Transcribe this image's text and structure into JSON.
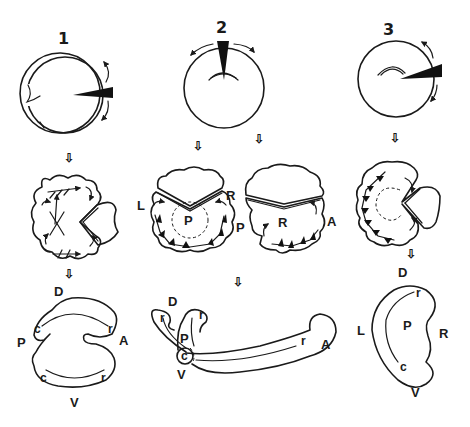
{
  "panels": [
    {
      "number": "1",
      "stage2_labels": [],
      "stage3_labels": {
        "top": "D",
        "left": "P",
        "right": "A",
        "bottom": "V",
        "c_upper": "c",
        "r_upper": "r",
        "c_lower": "c",
        "r_lower": "r"
      }
    },
    {
      "number": "2",
      "stage2_left_labels": {
        "left": "L",
        "right": "R",
        "center": "P"
      },
      "stage2_right_labels": {
        "left": "P",
        "center": "R",
        "right": "A"
      },
      "stage3_labels": {
        "top": "D",
        "p": "P",
        "v": "V",
        "a": "A",
        "c": "c",
        "r1": "r",
        "r2": "r",
        "r3": "r"
      }
    },
    {
      "number": "3",
      "stage3_labels": {
        "top": "D",
        "left": "L",
        "center": "P",
        "right": "R",
        "bottom": "V",
        "r": "r",
        "c": "c"
      }
    }
  ]
}
